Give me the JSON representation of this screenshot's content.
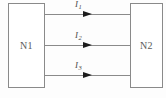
{
  "diagram": {
    "type": "block-diagram",
    "background_color": "#fdfdfd",
    "line_color": "#8a8a8a",
    "arrow_color": "#1c1c1c",
    "text_color": "#5a5a5a",
    "nodes": [
      {
        "id": "n1",
        "label": "N1",
        "side": "left"
      },
      {
        "id": "n2",
        "label": "N2",
        "side": "right"
      }
    ],
    "connections": [
      {
        "id": "wire1",
        "symbol": "I",
        "subscript": "1",
        "from": "n1",
        "to": "n2",
        "direction": "right",
        "y": 14
      },
      {
        "id": "wire2",
        "symbol": "I",
        "subscript": "2",
        "from": "n1",
        "to": "n2",
        "direction": "right",
        "y": 45
      },
      {
        "id": "wire3",
        "symbol": "I",
        "subscript": "3",
        "from": "n1",
        "to": "n2",
        "direction": "right",
        "y": 75
      }
    ]
  }
}
